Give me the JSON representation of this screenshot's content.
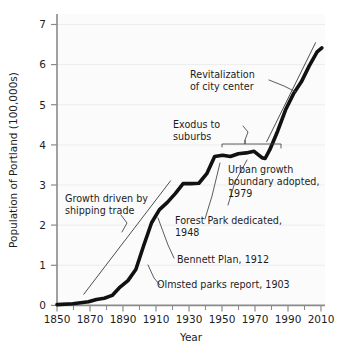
{
  "chart_data": {
    "type": "line",
    "title": "",
    "xlabel": "Year",
    "ylabel": "Population of Portland (100,000s)",
    "xlim": [
      1850,
      2020
    ],
    "ylim": [
      0,
      7.3
    ],
    "grid": false,
    "legend": "none",
    "x_ticks_major": [
      1850,
      1870,
      1890,
      1910,
      1930,
      1950,
      1970,
      1990,
      2010
    ],
    "x_tick_labels": [
      "1850",
      "1870",
      "1890",
      "1910",
      "1930",
      "1950",
      "1970",
      "1990",
      "2010"
    ],
    "x_ticks_minor": [
      1860,
      1880,
      1900,
      1920,
      1940,
      1960,
      1980,
      2000
    ],
    "y_ticks": [
      0,
      1,
      2,
      3,
      4,
      5,
      6,
      7
    ],
    "y_tick_labels": [
      "0",
      "1",
      "2",
      "3",
      "4",
      "5",
      "6",
      "7"
    ],
    "series": [
      {
        "name": "Population of Portland",
        "style": "thick-black-line",
        "x": [
          1850,
          1860,
          1870,
          1875,
          1880,
          1885,
          1890,
          1895,
          1900,
          1905,
          1910,
          1915,
          1920,
          1925,
          1930,
          1935,
          1940,
          1945,
          1950,
          1955,
          1960,
          1965,
          1970,
          1975,
          1980,
          1982,
          1985,
          1990,
          1995,
          2000,
          2005,
          2010,
          2015,
          2018
        ],
        "y": [
          0.02,
          0.04,
          0.09,
          0.15,
          0.18,
          0.25,
          0.46,
          0.62,
          0.9,
          1.5,
          2.07,
          2.4,
          2.58,
          2.8,
          3.05,
          3.05,
          3.06,
          3.3,
          3.73,
          3.76,
          3.73,
          3.8,
          3.82,
          3.86,
          3.7,
          3.68,
          3.9,
          4.37,
          4.9,
          5.3,
          5.6,
          6.0,
          6.35,
          6.45
        ]
      },
      {
        "name": "shipping-trade trend guide",
        "style": "thin-line",
        "x": [
          1867,
          1922
        ],
        "y": [
          0.28,
          3.12
        ]
      },
      {
        "name": "revitalization trend guide",
        "style": "thin-line",
        "x": [
          1983,
          2014
        ],
        "y": [
          4.1,
          6.58
        ]
      }
    ],
    "annotations": [
      {
        "id": "revitalization",
        "lines": [
          "Revitalization",
          "of city center"
        ],
        "text_x": 1930,
        "text_y": 5.85,
        "target_x": 1998,
        "target_y": 5.35
      },
      {
        "id": "exodus",
        "lines": [
          "Exodus to",
          "suburbs"
        ],
        "text_x": 1917,
        "text_y": 4.55,
        "bracket_from_x": 1950,
        "bracket_to_x": 1981,
        "bracket_y": 4.05
      },
      {
        "id": "urban-growth-boundary",
        "lines": [
          "Urban growth",
          "boundary adopted,",
          "1979"
        ],
        "text_x": 1959,
        "text_y": 3.45,
        "target_x": 1981,
        "target_y": 3.7
      },
      {
        "id": "growth-shipping",
        "lines": [
          "Growth driven by",
          "shipping trade"
        ],
        "text_x": 1856,
        "text_y": 2.52,
        "target_x": 1896,
        "target_y": 1.73
      },
      {
        "id": "forest-park",
        "lines": [
          "Forest Park dedicated,",
          "1948"
        ],
        "text_x": 1925,
        "text_y": 2.1,
        "target_x": 1949,
        "target_y": 3.55
      },
      {
        "id": "bennett-plan",
        "lines": [
          "Bennett Plan, 1912"
        ],
        "text_x": 1927,
        "text_y": 1.03,
        "target_x": 1913,
        "target_y": 2.15
      },
      {
        "id": "olmsted-report",
        "lines": [
          "Olmsted parks report, 1903"
        ],
        "text_x": 1913,
        "text_y": 0.32,
        "target_x": 1903,
        "target_y": 1.0
      }
    ]
  },
  "axes": {
    "y_title": "Population of Portland (100,000s)",
    "x_title": "Year"
  }
}
